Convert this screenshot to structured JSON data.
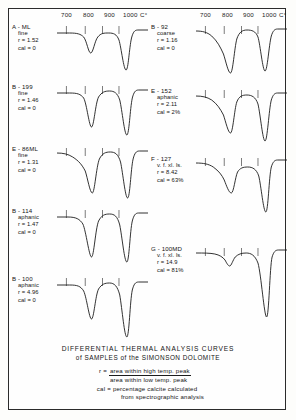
{
  "figure": {
    "caption_line1": "DIFFERENTIAL  THERMAL  ANALYSIS  CURVES",
    "caption_line2": "of SAMPLES of the SIMONSON DOLOMITE",
    "legend": {
      "r_key": "r =",
      "r_numerator": "area within high temp. peak",
      "r_denominator": "area within low temp. peak",
      "cal_key": "cal =",
      "cal_line1": "percentage calcite calculated",
      "cal_line2": "from spectrographic analysis"
    }
  },
  "axis": {
    "ticks": [
      "700",
      "800",
      "900",
      "1000"
    ],
    "unit": "C°"
  },
  "chart_data": {
    "type": "line",
    "title": "DIFFERENTIAL THERMAL ANALYSIS CURVES of SAMPLES of the SIMONSON DOLOMITE",
    "xlabel": "C°",
    "ylabel": "",
    "xlim": [
      640,
      1060
    ],
    "xticks": [
      700,
      800,
      900,
      1000
    ],
    "grid": false,
    "legend_position": "none",
    "note": "Endothermic (downward) differential thermal peaks; left column 5 curves, right column 4 curves",
    "series": [
      {
        "name": "A-ML",
        "column": "left",
        "texture": "fine",
        "r": "1.52",
        "cal": "0",
        "peaks": [
          {
            "temp_c": 800,
            "depth_rel": 0.55
          },
          {
            "temp_c": 930,
            "depth_rel": 1.0
          }
        ]
      },
      {
        "name": "B-199",
        "column": "left",
        "texture": "fine",
        "r": "1.46",
        "cal": "0",
        "peaks": [
          {
            "temp_c": 800,
            "depth_rel": 0.8
          },
          {
            "temp_c": 930,
            "depth_rel": 1.0
          }
        ]
      },
      {
        "name": "E-86ML",
        "column": "left",
        "texture": "fine",
        "r": "1.31",
        "cal": "0",
        "peaks": [
          {
            "temp_c": 800,
            "depth_rel": 0.85
          },
          {
            "temp_c": 930,
            "depth_rel": 1.0
          }
        ]
      },
      {
        "name": "B-114",
        "column": "left",
        "texture": "aphanic",
        "r": "1.47",
        "cal": "0",
        "peaks": [
          {
            "temp_c": 800,
            "depth_rel": 0.9
          },
          {
            "temp_c": 930,
            "depth_rel": 1.0
          }
        ]
      },
      {
        "name": "B-100",
        "column": "left",
        "texture": "aphanic",
        "r": "4.96",
        "cal": "0",
        "peaks": [
          {
            "temp_c": 800,
            "depth_rel": 0.7
          },
          {
            "temp_c": 930,
            "depth_rel": 1.0
          }
        ]
      },
      {
        "name": "B-92",
        "column": "right",
        "texture": "coarse",
        "r": "1.16",
        "cal": "0",
        "peaks": [
          {
            "temp_c": 800,
            "depth_rel": 0.95
          },
          {
            "temp_c": 940,
            "depth_rel": 1.0
          }
        ]
      },
      {
        "name": "E-152",
        "column": "right",
        "texture": "aphanic",
        "r": "2.11",
        "cal": "2%",
        "peaks": [
          {
            "temp_c": 800,
            "depth_rel": 0.85
          },
          {
            "temp_c": 935,
            "depth_rel": 1.0
          }
        ]
      },
      {
        "name": "F-127",
        "column": "right",
        "texture": "v. f. xl. ls.",
        "r": "8.42",
        "cal": "63%",
        "peaks": [
          {
            "temp_c": 800,
            "depth_rel": 0.45
          },
          {
            "temp_c": 935,
            "depth_rel": 1.0
          }
        ]
      },
      {
        "name": "G-100MD",
        "column": "right",
        "texture": "v. f. xl. ls.",
        "r": "14.9",
        "cal": "81%",
        "peaks": [
          {
            "temp_c": 800,
            "depth_rel": 0.1
          },
          {
            "temp_c": 940,
            "depth_rel": 1.0
          }
        ]
      }
    ]
  },
  "curves": {
    "left": [
      {
        "id": "A - ML",
        "texture": "fine",
        "r": "r = 1.52",
        "cal": "cal = 0",
        "top": 14,
        "height": 58,
        "path": "M0,10 L16,10 C26,10 30,11 34,14 C38,18 40,30 43,30 C46,30 48,18 52,14 C56,10 60,10 66,10 C72,10 76,11 79,17 C82,25 85,47 88,47 C91,47 92,25 95,15 C97,9 99,7 103,7 L116,7"
      },
      {
        "id": "B - 199",
        "texture": "fine",
        "r": "r = 1.46",
        "cal": "cal = 0",
        "top": 74,
        "height": 60,
        "path": "M0,10 L16,10 C26,10 30,11 34,15 C38,21 41,44 44,44 C47,44 49,20 53,14 C57,9 61,8 67,8 C73,8 77,10 80,17 C83,27 86,52 89,52 C92,52 93,26 96,15 C98,9 100,7 104,7 L116,7"
      },
      {
        "id": "E - 86ML",
        "texture": "fine",
        "r": "r = 1.31",
        "cal": "cal = 0",
        "top": 136,
        "height": 60,
        "path": "M0,8 C8,8 14,9 20,12 C28,16 32,20 36,26 C39,33 42,48 45,48 C48,48 50,22 54,14 C58,8 62,7 68,7 C74,7 78,9 81,17 C84,28 87,53 90,53 C93,53 94,25 97,14 C99,8 101,6 105,6 L116,6"
      },
      {
        "id": "B - 114",
        "texture": "aphanic",
        "r": "r = 1.47",
        "cal": "cal = 0",
        "top": 198,
        "height": 62,
        "path": "M0,10 L14,10 C24,10 29,12 33,17 C37,24 41,50 44,50 C47,50 49,22 53,14 C57,8 61,7 67,7 C73,7 77,9 80,18 C83,30 86,55 89,55 C92,55 93,24 96,14 C98,8 100,6 104,6 L116,6"
      },
      {
        "id": "B - 100",
        "texture": "aphanic",
        "r": "r = 4.96",
        "cal": "cal = 0",
        "top": 266,
        "height": 68,
        "path": "M0,10 L16,10 C26,10 30,11 34,16 C38,23 41,44 44,44 C47,44 49,20 53,14 C57,9 61,8 67,8 C73,8 77,11 80,20 C83,34 86,62 89,62 C92,62 93,26 96,15 C98,9 100,7 104,7 L116,7"
      }
    ],
    "right": [
      {
        "id": "B - 92",
        "texture": "coarse",
        "r": "r = 1.16",
        "cal": "cal = 0",
        "top": 14,
        "height": 60,
        "path": "M0,8 C8,8 14,9 20,13 C27,18 31,24 35,31 C38,38 41,50 44,50 C47,50 49,25 52,16 C55,9 59,7 65,7 C71,7 76,8 79,14 C82,22 85,48 88,48 C91,48 93,22 96,13 C98,8 100,6 104,6 L116,6"
      },
      {
        "id": "E - 152",
        "texture": "aphanic",
        "r": "r = 2.11",
        "cal": "cal = 2%",
        "top": 78,
        "height": 62,
        "path": "M0,9 C8,9 14,10 20,13 C27,17 31,22 35,28 C38,35 41,46 44,46 C47,46 49,22 52,15 C55,9 59,8 65,8 C71,8 76,10 79,17 C82,27 85,54 88,54 C91,54 93,22 96,13 C98,8 100,6 104,6 L116,6"
      },
      {
        "id": "F - 127",
        "texture": "v. f. xl. ls.",
        "r": "r = 8.42",
        "cal": "cal = 63%",
        "top": 146,
        "height": 62,
        "path": "M0,8 C10,8 16,9 22,12 C29,16 33,20 36,25 C39,31 42,38 45,38 C48,38 50,22 53,17 C56,13 60,12 66,12 C72,12 77,14 80,21 C83,31 86,57 89,57 C92,57 93,22 96,12 C98,7 100,5 104,5 L116,5"
      },
      {
        "id": "G - 100MD",
        "texture": "v. f. xl. ls.",
        "r": "r = 14.9",
        "cal": "cal = 81%",
        "top": 236,
        "height": 82,
        "path": "M0,8 C10,8 18,8 24,9 C30,10 34,12 37,15 C39,18 41,21 43,21 C45,21 47,15 50,12 C54,9 58,8 64,8 C70,8 75,10 79,18 C83,29 87,72 90,72 C93,72 94,22 97,12 C99,7 101,5 105,5 L116,5"
      }
    ]
  }
}
